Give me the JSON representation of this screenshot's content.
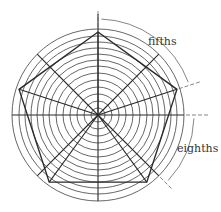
{
  "diagram": {
    "labels": {
      "fifths": "fifths",
      "eighths": "eighths"
    },
    "center": [
      98,
      115
    ],
    "circle_radii": [
      7,
      14,
      21,
      28,
      35,
      42,
      49,
      55,
      61,
      67,
      73,
      79,
      86
    ],
    "pentagon_radius": 83,
    "colors": {
      "stroke": "#2a2a2a",
      "circle": "#555555",
      "annotation": "#666666"
    }
  }
}
